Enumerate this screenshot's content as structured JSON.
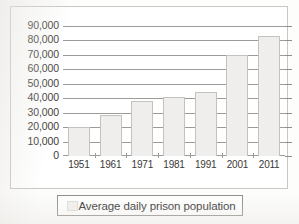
{
  "legend": {
    "label": "Average daily prison population",
    "swatch_color": "#f2f1ef"
  },
  "axes": {
    "y_ticks": [
      "90,000",
      "80,000",
      "70,000",
      "60,000",
      "50,000",
      "40,000",
      "30,000",
      "20,000",
      "10,000",
      "0"
    ],
    "x_ticks": [
      "1951",
      "1961",
      "1971",
      "1981",
      "1991",
      "2001",
      "2011"
    ]
  },
  "colors": {
    "bar_fill": "#efeeec",
    "bar_border": "#c3c2bd",
    "gridline": "#9b9b98",
    "frame": "#c9c7c2",
    "text": "#3a3a38",
    "background": "#ffffff"
  },
  "chart_data": {
    "type": "bar",
    "title": "",
    "subtitle": "",
    "xlabel": "",
    "ylabel": "",
    "categories": [
      "1951",
      "1961",
      "1971",
      "1981",
      "1991",
      "2001",
      "2011"
    ],
    "values": [
      20000,
      28500,
      38000,
      41000,
      44000,
      70000,
      83000
    ],
    "series": [
      {
        "name": "Average daily prison population",
        "values": [
          20000,
          28500,
          38000,
          41000,
          44000,
          70000,
          83000
        ]
      }
    ],
    "ylim": [
      0,
      90000
    ],
    "y_ticks": [
      0,
      10000,
      20000,
      30000,
      40000,
      50000,
      60000,
      70000,
      80000,
      90000
    ],
    "y_tick_labels": [
      "0",
      "10,000",
      "20,000",
      "30,000",
      "40,000",
      "50,000",
      "60,000",
      "70,000",
      "80,000",
      "90,000"
    ],
    "grid": true,
    "grid_axis": "y",
    "legend_position": "bottom",
    "legend_entries": [
      "Average daily prison population"
    ],
    "annotations": []
  }
}
